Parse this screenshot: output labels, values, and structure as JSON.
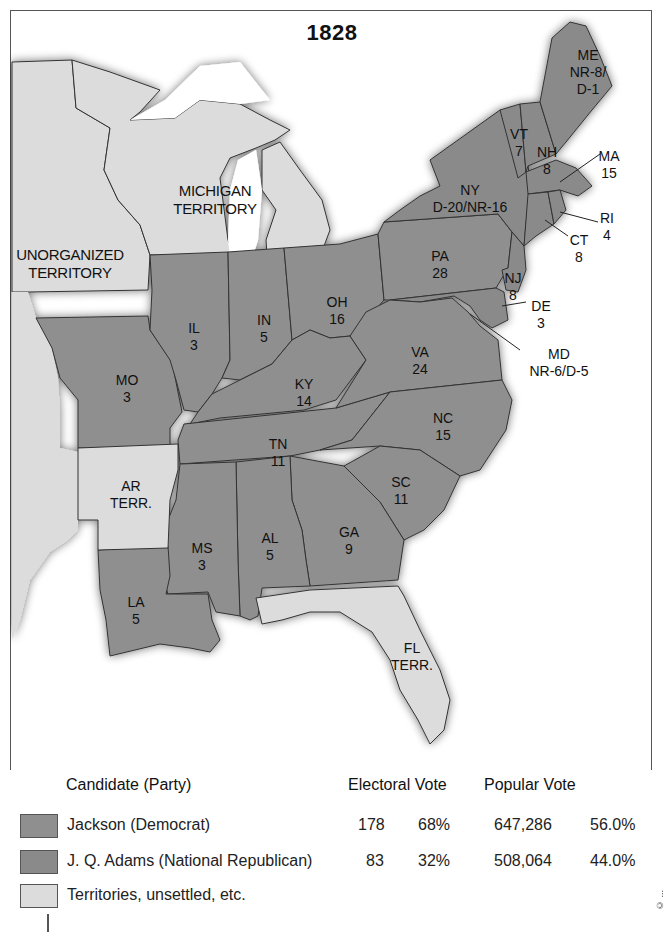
{
  "title": "1828",
  "colors": {
    "jackson": "#8f8f8f",
    "adams": "#8a8a8a",
    "territory": "#dcdcdc",
    "water": "#ffffff",
    "border": "#333333"
  },
  "territories": [
    {
      "id": "unorganized",
      "lines": [
        "UNORGANIZED",
        "TERRITORY"
      ]
    },
    {
      "id": "michigan",
      "lines": [
        "MICHIGAN",
        "TERRITORY"
      ]
    },
    {
      "id": "ar",
      "lines": [
        "AR",
        "TERR."
      ]
    },
    {
      "id": "fl",
      "lines": [
        "FL",
        "TERR."
      ]
    }
  ],
  "states": [
    {
      "abbr": "ME",
      "votes": "NR-8/",
      "votes2": "D-1",
      "winner": "split"
    },
    {
      "abbr": "VT",
      "votes": "7",
      "winner": "adams"
    },
    {
      "abbr": "NH",
      "votes": "8",
      "winner": "adams"
    },
    {
      "abbr": "MA",
      "votes": "15",
      "winner": "adams"
    },
    {
      "abbr": "RI",
      "votes": "4",
      "winner": "adams"
    },
    {
      "abbr": "CT",
      "votes": "8",
      "winner": "adams"
    },
    {
      "abbr": "NY",
      "votes": "D-20/NR-16",
      "winner": "split"
    },
    {
      "abbr": "PA",
      "votes": "28",
      "winner": "jackson"
    },
    {
      "abbr": "NJ",
      "votes": "8",
      "winner": "adams"
    },
    {
      "abbr": "DE",
      "votes": "3",
      "winner": "adams"
    },
    {
      "abbr": "MD",
      "votes": "NR-6/D-5",
      "winner": "split"
    },
    {
      "abbr": "VA",
      "votes": "24",
      "winner": "jackson"
    },
    {
      "abbr": "NC",
      "votes": "15",
      "winner": "jackson"
    },
    {
      "abbr": "SC",
      "votes": "11",
      "winner": "jackson"
    },
    {
      "abbr": "GA",
      "votes": "9",
      "winner": "jackson"
    },
    {
      "abbr": "AL",
      "votes": "5",
      "winner": "jackson"
    },
    {
      "abbr": "MS",
      "votes": "3",
      "winner": "jackson"
    },
    {
      "abbr": "LA",
      "votes": "5",
      "winner": "jackson"
    },
    {
      "abbr": "TN",
      "votes": "11",
      "winner": "jackson"
    },
    {
      "abbr": "KY",
      "votes": "14",
      "winner": "jackson"
    },
    {
      "abbr": "OH",
      "votes": "16",
      "winner": "jackson"
    },
    {
      "abbr": "IN",
      "votes": "5",
      "winner": "jackson"
    },
    {
      "abbr": "IL",
      "votes": "3",
      "winner": "jackson"
    },
    {
      "abbr": "MO",
      "votes": "3",
      "winner": "jackson"
    }
  ],
  "legend": {
    "headers": {
      "candidate": "Candidate (Party)",
      "electoral": "Electoral Vote",
      "popular": "Popular Vote"
    },
    "rows": [
      {
        "label": "Jackson (Democrat)",
        "ev": "178",
        "ev_pct": "68%",
        "pv": "647,286",
        "pv_pct": "56.0%"
      },
      {
        "label": "J. Q. Adams (National Republican)",
        "ev": "83",
        "ev_pct": "32%",
        "pv": "508,064",
        "pv_pct": "44.0%"
      },
      {
        "label": "Territories, unsettled, etc.",
        "ev": "",
        "ev_pct": "",
        "pv": "",
        "pv_pct": ""
      }
    ]
  },
  "side_credit": "© ..."
}
